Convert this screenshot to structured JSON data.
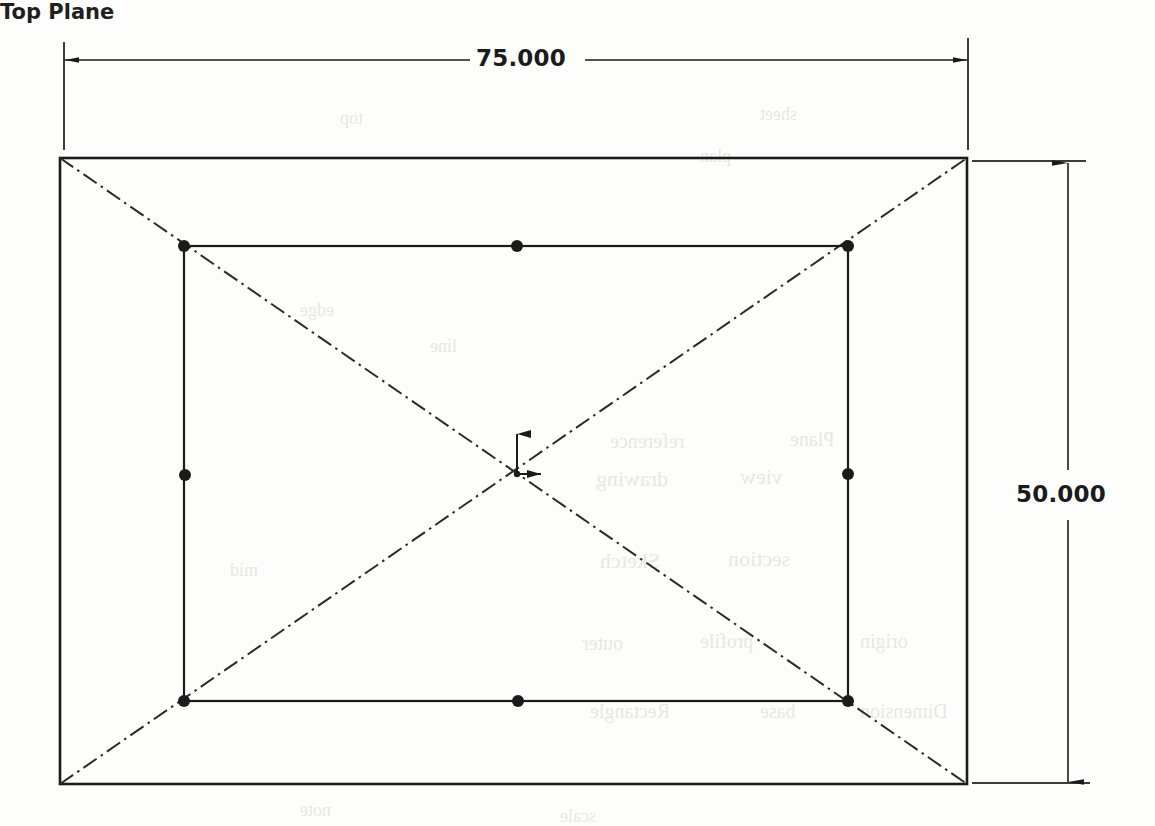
{
  "drawing": {
    "type": "cad-sketch",
    "title_label": "Top Plane",
    "background_color": "#fdfdfc",
    "line_color": "#1b1b1b",
    "dimensions": {
      "horizontal": {
        "value": "75.000",
        "orientation": "horizontal",
        "position": "top"
      },
      "vertical": {
        "value": "50.000",
        "orientation": "vertical",
        "position": "right"
      }
    },
    "outer_rectangle": {
      "left": 60,
      "top": 158,
      "right": 967,
      "bottom": 784,
      "width_units": "75.000",
      "height_units": "50.000"
    },
    "inner_rectangle": {
      "left": 184,
      "top": 246,
      "right": 848,
      "bottom": 701
    },
    "vertex_points": [
      {
        "name": "inner-top-left",
        "x": 184,
        "y": 246
      },
      {
        "name": "inner-top-mid",
        "x": 517,
        "y": 246
      },
      {
        "name": "inner-top-right",
        "x": 848,
        "y": 246
      },
      {
        "name": "inner-left-mid",
        "x": 185,
        "y": 475
      },
      {
        "name": "inner-right-mid",
        "x": 848,
        "y": 474
      },
      {
        "name": "inner-bottom-left",
        "x": 184,
        "y": 701
      },
      {
        "name": "inner-bottom-mid",
        "x": 518,
        "y": 701
      },
      {
        "name": "inner-bottom-right",
        "x": 848,
        "y": 701
      }
    ],
    "construction_lines": [
      {
        "name": "diagonal-tl-br",
        "x1": 60,
        "y1": 158,
        "x2": 967,
        "y2": 784
      },
      {
        "name": "diagonal-bl-tr",
        "x1": 60,
        "y1": 784,
        "x2": 967,
        "y2": 158
      }
    ],
    "origin": {
      "x": 517,
      "y": 474,
      "axis_x_label": "X",
      "axis_y_label": "Y"
    },
    "watermark_fragments": [
      {
        "text": "reference",
        "x": 610,
        "y": 430,
        "size": 20
      },
      {
        "text": "Plane",
        "x": 790,
        "y": 428,
        "size": 20
      },
      {
        "text": "drawing",
        "x": 596,
        "y": 466,
        "size": 22
      },
      {
        "text": "view",
        "x": 740,
        "y": 464,
        "size": 22
      },
      {
        "text": "Sketch",
        "x": 600,
        "y": 548,
        "size": 22
      },
      {
        "text": "section",
        "x": 728,
        "y": 546,
        "size": 22
      },
      {
        "text": "outer",
        "x": 582,
        "y": 632,
        "size": 20
      },
      {
        "text": "profile",
        "x": 700,
        "y": 630,
        "size": 20
      },
      {
        "text": "origin",
        "x": 860,
        "y": 630,
        "size": 20
      },
      {
        "text": "Rectangle",
        "x": 590,
        "y": 700,
        "size": 20
      },
      {
        "text": "base",
        "x": 760,
        "y": 700,
        "size": 20
      },
      {
        "text": "Dimension",
        "x": 860,
        "y": 700,
        "size": 20
      },
      {
        "text": "top",
        "x": 340,
        "y": 108,
        "size": 18
      },
      {
        "text": "sheet",
        "x": 760,
        "y": 104,
        "size": 18
      },
      {
        "text": "plan",
        "x": 700,
        "y": 146,
        "size": 18
      },
      {
        "text": "edge",
        "x": 300,
        "y": 300,
        "size": 18
      },
      {
        "text": "line",
        "x": 430,
        "y": 336,
        "size": 18
      },
      {
        "text": "mid",
        "x": 230,
        "y": 560,
        "size": 18
      },
      {
        "text": "note",
        "x": 300,
        "y": 800,
        "size": 18
      },
      {
        "text": "scale",
        "x": 560,
        "y": 806,
        "size": 18
      }
    ]
  }
}
